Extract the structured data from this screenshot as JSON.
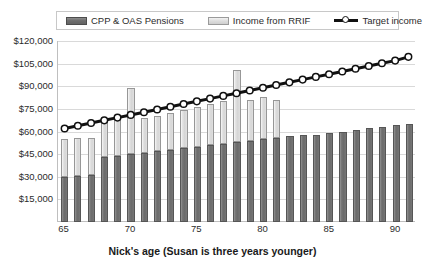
{
  "legend": {
    "entries": [
      {
        "label": "CPP & OAS Pensions",
        "marker": "dark-swatch-icon",
        "color": "#6e6e6e"
      },
      {
        "label": "Income from RRIF",
        "marker": "light-swatch-icon",
        "color": "#dcdcdc"
      },
      {
        "label": "Target income",
        "marker": "line-marker-icon",
        "color": "#111111"
      }
    ]
  },
  "axis": {
    "x_title": "Nick's age (Susan is three years younger)",
    "y_tick_labels": [
      "$120,000",
      "$105,000",
      "$90,000",
      "$75,000",
      "$60,000",
      "$45,000",
      "$30,000",
      "$15,000"
    ],
    "x_tick_labels": [
      "65",
      "70",
      "75",
      "80",
      "85",
      "90"
    ]
  },
  "chart_data": {
    "type": "bar",
    "subtype": "stacked-bar-with-line-overlay",
    "title": "",
    "xlabel": "Nick's age (Susan is three years younger)",
    "ylabel": "",
    "ylim": [
      0,
      120000
    ],
    "ytick_step": 15000,
    "yticks": [
      15000,
      30000,
      45000,
      60000,
      75000,
      90000,
      105000,
      120000
    ],
    "grid": true,
    "legend_position": "top",
    "categories": [
      65,
      66,
      67,
      68,
      69,
      70,
      71,
      72,
      73,
      74,
      75,
      76,
      77,
      78,
      79,
      80,
      81,
      82,
      83,
      84,
      85,
      86,
      87,
      88,
      89,
      90,
      91
    ],
    "xtick_labels": [
      "65",
      "70",
      "75",
      "80",
      "85",
      "90"
    ],
    "xtick_categories": [
      65,
      70,
      75,
      80,
      85,
      90
    ],
    "series": [
      {
        "name": "CPP & OAS Pensions",
        "type": "bar-segment",
        "stack": "income",
        "color": "#6e6e6e",
        "values": [
          30000,
          30500,
          31000,
          43000,
          44000,
          45000,
          46000,
          47000,
          48000,
          49000,
          50000,
          51000,
          52000,
          53000,
          54000,
          55000,
          56000,
          57000,
          57500,
          58000,
          59000,
          60000,
          61000,
          62000,
          63000,
          64000,
          65000
        ]
      },
      {
        "name": "Income from RRIF",
        "type": "bar-segment",
        "stack": "income",
        "color": "#dcdcdc",
        "values": [
          25000,
          25500,
          25000,
          24000,
          24000,
          44000,
          23000,
          23500,
          24000,
          25000,
          26000,
          27000,
          28000,
          48000,
          27000,
          28000,
          25000,
          0,
          0,
          0,
          0,
          0,
          0,
          0,
          0,
          0,
          0
        ]
      },
      {
        "name": "Target income",
        "type": "line",
        "color": "#111111",
        "marker": "circle-white-fill",
        "values": [
          62000,
          63800,
          65600,
          67400,
          69200,
          71000,
          72800,
          74600,
          76400,
          78200,
          80000,
          81800,
          83600,
          85400,
          87200,
          89000,
          90800,
          92600,
          94400,
          96200,
          98000,
          99800,
          101600,
          103400,
          105200,
          107000,
          109500
        ]
      }
    ],
    "stacked_totals": [
      55000,
      56000,
      56000,
      67000,
      68000,
      89000,
      69000,
      70500,
      72000,
      74000,
      76000,
      78000,
      80000,
      101000,
      81000,
      83000,
      81000,
      57000,
      57500,
      58000,
      59000,
      60000,
      61000,
      62000,
      63000,
      64000,
      65000
    ]
  }
}
